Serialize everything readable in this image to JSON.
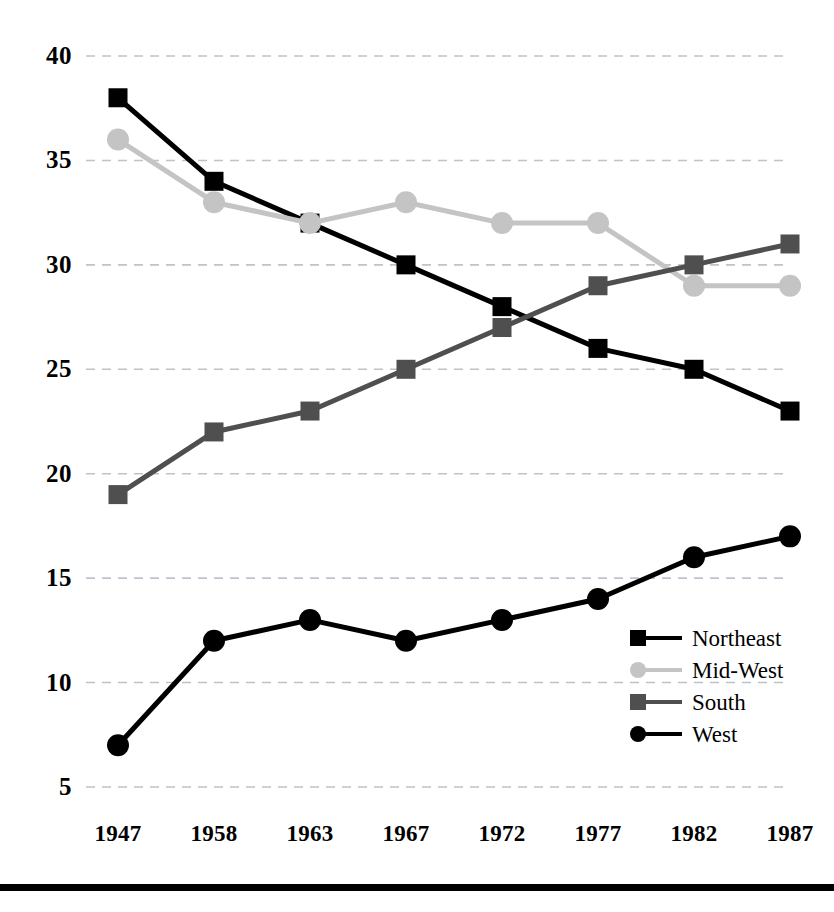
{
  "chart_data": {
    "type": "line",
    "title": "",
    "subtitle": "",
    "xlabel": "",
    "ylabel": "",
    "categories": [
      "1947",
      "1958",
      "1963",
      "1967",
      "1972",
      "1977",
      "1982",
      "1987"
    ],
    "ylim": [
      5,
      40
    ],
    "ytick_labels": [
      "40",
      "35",
      "30",
      "25",
      "20",
      "15",
      "10",
      "5"
    ],
    "ytick_values": [
      40,
      35,
      30,
      25,
      20,
      15,
      10,
      5
    ],
    "grid": true,
    "grid_style": "dashed-horizontal",
    "legend_position": "inside-right-lower",
    "series": [
      {
        "name": "Northeast",
        "values": [
          38,
          34,
          32,
          30,
          28,
          26,
          25,
          23
        ],
        "color": "#000000",
        "marker": "square"
      },
      {
        "name": "Mid-West",
        "values": [
          36,
          33,
          32,
          33,
          32,
          32,
          29,
          29
        ],
        "color": "#c4c4c4",
        "marker": "circle"
      },
      {
        "name": "South",
        "values": [
          19,
          22,
          23,
          25,
          27,
          29,
          30,
          31
        ],
        "color": "#4f4f4f",
        "marker": "square"
      },
      {
        "name": "West",
        "values": [
          7,
          12,
          13,
          12,
          13,
          14,
          16,
          17
        ],
        "color": "#000000",
        "marker": "circle"
      }
    ]
  },
  "legend": {
    "items": [
      {
        "label": "Northeast",
        "color": "#000000",
        "marker": "square"
      },
      {
        "label": "Mid-West",
        "color": "#c4c4c4",
        "marker": "circle"
      },
      {
        "label": "South",
        "color": "#4f4f4f",
        "marker": "square"
      },
      {
        "label": "West",
        "color": "#000000",
        "marker": "circle"
      }
    ]
  },
  "colors": {
    "background": "#ffffff",
    "axis_text": "#000000",
    "gridline": "#b9c4cf",
    "rule": "#000000"
  }
}
